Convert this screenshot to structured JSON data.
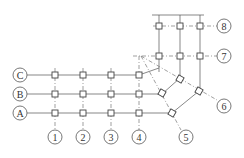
{
  "diagram": {
    "type": "structural-axis-grid",
    "row_axes": [
      {
        "label": "C",
        "y": 75
      },
      {
        "label": "B",
        "y": 94
      },
      {
        "label": "A",
        "y": 113
      }
    ],
    "column_axes": [
      {
        "label": "1",
        "x": 55
      },
      {
        "label": "2",
        "x": 83
      },
      {
        "label": "3",
        "x": 111
      },
      {
        "label": "4",
        "x": 139
      }
    ],
    "radial_axes": [
      {
        "label": "5",
        "bubble": [
          186,
          137
        ]
      },
      {
        "label": "6",
        "bubble": [
          224,
          106
        ]
      }
    ],
    "upper_axes": [
      {
        "label": "7",
        "y": 56
      },
      {
        "label": "8",
        "y": 26
      }
    ],
    "colors": {
      "line": "#555555",
      "column": "#444444",
      "background": "#ffffff"
    }
  }
}
